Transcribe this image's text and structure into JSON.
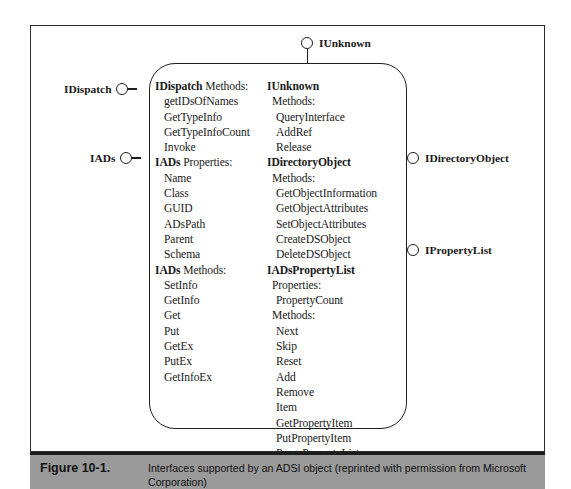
{
  "figure": {
    "caption_label": "Figure 10-1.",
    "caption_text": "Interfaces supported by an ADSI object (reprinted with permission from Microsoft Corporation)"
  },
  "connectors": {
    "top": {
      "label": "IUnknown",
      "icon": "interface-lollipop-icon"
    },
    "left": [
      {
        "label": "IDispatch",
        "icon": "interface-lollipop-icon"
      },
      {
        "label": "IADs",
        "icon": "interface-lollipop-icon"
      }
    ],
    "right": [
      {
        "label": "IDirectoryObject",
        "icon": "interface-lollipop-icon"
      },
      {
        "label": "IPropertyList",
        "icon": "interface-lollipop-icon"
      }
    ]
  },
  "left_column": [
    {
      "text": "IDispatch Methods:",
      "bold_prefix": "IDispatch",
      "rest": " Methods:",
      "kind": "head"
    },
    {
      "text": "getIDsOfNames",
      "kind": "item"
    },
    {
      "text": "GetTypeInfo",
      "kind": "item"
    },
    {
      "text": "GetTypeInfoCount",
      "kind": "item"
    },
    {
      "text": "Invoke",
      "kind": "item"
    },
    {
      "text": "IADs Properties:",
      "bold_prefix": "IADs",
      "rest": " Properties:",
      "kind": "head"
    },
    {
      "text": "Name",
      "kind": "item"
    },
    {
      "text": "Class",
      "kind": "item"
    },
    {
      "text": "GUID",
      "kind": "item"
    },
    {
      "text": "ADsPath",
      "kind": "item"
    },
    {
      "text": "Parent",
      "kind": "item"
    },
    {
      "text": "Schema",
      "kind": "item"
    },
    {
      "text": "IADs Methods:",
      "bold_prefix": "IADs",
      "rest": " Methods:",
      "kind": "head"
    },
    {
      "text": "SetInfo",
      "kind": "item"
    },
    {
      "text": "GetInfo",
      "kind": "item"
    },
    {
      "text": "Get",
      "kind": "item"
    },
    {
      "text": "Put",
      "kind": "item"
    },
    {
      "text": "GetEx",
      "kind": "item"
    },
    {
      "text": "PutEx",
      "kind": "item"
    },
    {
      "text": "GetInfoEx",
      "kind": "item"
    }
  ],
  "right_column": [
    {
      "text": "IUnknown",
      "kind": "head"
    },
    {
      "text": "Methods:",
      "kind": "sub"
    },
    {
      "text": "QueryInterface",
      "kind": "item"
    },
    {
      "text": "AddRef",
      "kind": "item"
    },
    {
      "text": "Release",
      "kind": "item"
    },
    {
      "text": "IDirectoryObject",
      "kind": "head"
    },
    {
      "text": "Methods:",
      "kind": "sub"
    },
    {
      "text": "GetObjectInformation",
      "kind": "item"
    },
    {
      "text": "GetObjectAttributes",
      "kind": "item"
    },
    {
      "text": "SetObjectAttributes",
      "kind": "item"
    },
    {
      "text": "CreateDSObject",
      "kind": "item"
    },
    {
      "text": "DeleteDSObject",
      "kind": "item"
    },
    {
      "text": "IADsPropertyList",
      "kind": "head"
    },
    {
      "text": "Properties:",
      "kind": "sub"
    },
    {
      "text": "PropertyCount",
      "kind": "item"
    },
    {
      "text": "Methods:",
      "kind": "sub"
    },
    {
      "text": "Next",
      "kind": "item"
    },
    {
      "text": "Skip",
      "kind": "item"
    },
    {
      "text": "Reset",
      "kind": "item"
    },
    {
      "text": "Add",
      "kind": "item"
    },
    {
      "text": "Remove",
      "kind": "item"
    },
    {
      "text": "Item",
      "kind": "item"
    },
    {
      "text": "GetPropertyItem",
      "kind": "item"
    },
    {
      "text": "PutPropertyItem",
      "kind": "item"
    },
    {
      "text": "PurgePropertyList",
      "kind": "item"
    }
  ],
  "colors": {
    "line": "#1f1f1f",
    "caption_bar": "#9a9a9a",
    "page": "#ffffff"
  }
}
